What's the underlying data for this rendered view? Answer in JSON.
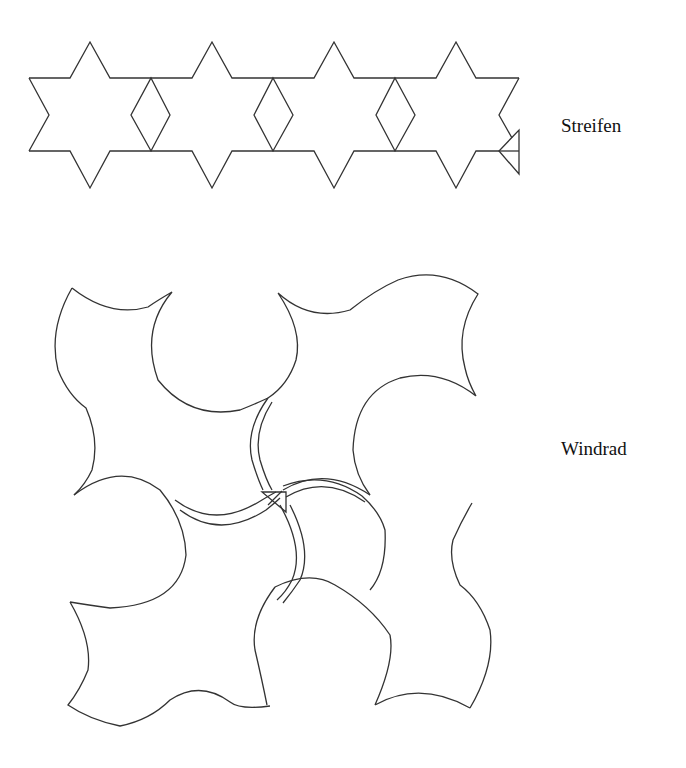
{
  "figures": [
    {
      "id": "streifen",
      "label": "Streifen",
      "description": "Strip of four six-pointed stars joined by rhombi, with a small triangle marker at the right end"
    },
    {
      "id": "windrad",
      "label": "Windrad",
      "description": "Pinwheel tiling of four curved tiles around a central point with double-line arcs and a small triangle marker at the center"
    }
  ],
  "colors": {
    "stroke": "#333333",
    "text": "#111111",
    "background": "#ffffff"
  }
}
